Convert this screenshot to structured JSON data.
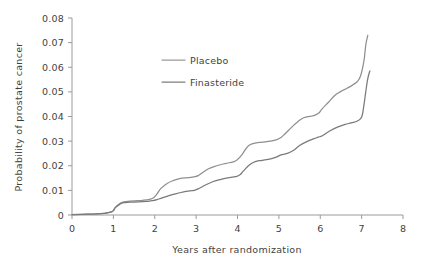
{
  "chart_data": {
    "type": "line",
    "title": "",
    "xlabel": "Years after randomization",
    "ylabel": "Probability of prostate cancer",
    "xlim": [
      0,
      8
    ],
    "ylim": [
      0,
      0.08
    ],
    "grid": false,
    "legend_position": "upper-left-inside",
    "x_ticks": [
      "0",
      "1",
      "2",
      "3",
      "4",
      "5",
      "6",
      "7",
      "8"
    ],
    "y_ticks": [
      "0",
      "0.01",
      "0.02",
      "0.03",
      "0.04",
      "0.05",
      "0.06",
      "0.07",
      "0.08"
    ],
    "x_tick_values": [
      0,
      1,
      2,
      3,
      4,
      5,
      6,
      7,
      8
    ],
    "y_tick_values": [
      0,
      0.01,
      0.02,
      0.03,
      0.04,
      0.05,
      0.06,
      0.07,
      0.08
    ],
    "series": [
      {
        "name": "Placebo",
        "color": "#8f8f8f",
        "x": [
          0,
          0.25,
          0.5,
          0.7,
          0.85,
          0.95,
          1.0,
          1.05,
          1.15,
          1.25,
          1.4,
          1.6,
          1.8,
          1.95,
          2.05,
          2.15,
          2.3,
          2.45,
          2.6,
          2.8,
          2.95,
          3.05,
          3.15,
          3.3,
          3.5,
          3.7,
          3.9,
          4.0,
          4.1,
          4.2,
          4.3,
          4.45,
          4.6,
          4.8,
          4.95,
          5.05,
          5.15,
          5.3,
          5.45,
          5.6,
          5.8,
          5.95,
          6.05,
          6.2,
          6.35,
          6.5,
          6.65,
          6.8,
          6.95,
          7.05,
          7.1,
          7.15
        ],
        "y": [
          0.0002,
          0.0003,
          0.0004,
          0.0006,
          0.0009,
          0.0013,
          0.0018,
          0.0032,
          0.0046,
          0.0053,
          0.0056,
          0.0058,
          0.0061,
          0.0068,
          0.0085,
          0.0108,
          0.0128,
          0.014,
          0.0148,
          0.0152,
          0.0155,
          0.016,
          0.0172,
          0.0188,
          0.02,
          0.0209,
          0.0216,
          0.0225,
          0.0243,
          0.0268,
          0.0285,
          0.0293,
          0.0296,
          0.03,
          0.0306,
          0.0315,
          0.033,
          0.0355,
          0.0378,
          0.0395,
          0.0402,
          0.0412,
          0.0432,
          0.0458,
          0.0485,
          0.0502,
          0.0515,
          0.053,
          0.0555,
          0.062,
          0.069,
          0.073
        ]
      },
      {
        "name": "Finasteride",
        "color": "#7a7a7a",
        "x": [
          0,
          0.25,
          0.5,
          0.7,
          0.85,
          0.95,
          1.0,
          1.05,
          1.15,
          1.25,
          1.4,
          1.6,
          1.8,
          1.95,
          2.1,
          2.3,
          2.5,
          2.7,
          2.85,
          2.95,
          3.05,
          3.2,
          3.4,
          3.6,
          3.8,
          3.95,
          4.05,
          4.15,
          4.3,
          4.45,
          4.6,
          4.8,
          4.95,
          5.05,
          5.2,
          5.35,
          5.5,
          5.7,
          5.85,
          5.95,
          6.05,
          6.2,
          6.4,
          6.6,
          6.75,
          6.9,
          7.0,
          7.05,
          7.1,
          7.15,
          7.2
        ],
        "y": [
          0.0002,
          0.0003,
          0.0004,
          0.0006,
          0.0009,
          0.0013,
          0.0018,
          0.003,
          0.0043,
          0.005,
          0.0052,
          0.0053,
          0.0055,
          0.0058,
          0.0065,
          0.0076,
          0.0086,
          0.0094,
          0.0098,
          0.01,
          0.0106,
          0.012,
          0.0135,
          0.0145,
          0.0152,
          0.0156,
          0.0162,
          0.018,
          0.0205,
          0.0218,
          0.0222,
          0.0228,
          0.0236,
          0.0244,
          0.025,
          0.0262,
          0.0282,
          0.03,
          0.031,
          0.0316,
          0.0322,
          0.0338,
          0.0356,
          0.0368,
          0.0374,
          0.0382,
          0.0398,
          0.044,
          0.05,
          0.0555,
          0.0585
        ]
      }
    ]
  },
  "legend": {
    "entries": [
      {
        "label": "Placebo",
        "swatch_color": "#9a9a9a"
      },
      {
        "label": "Finasteride",
        "swatch_color": "#7e7e7e"
      }
    ]
  },
  "axes": {
    "x_title": "Years after randomization",
    "y_title": "Probability of prostate cancer"
  }
}
